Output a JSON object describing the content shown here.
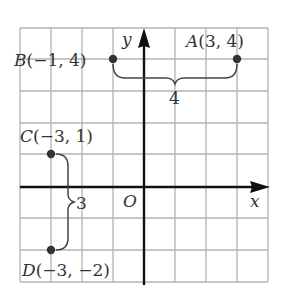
{
  "grid": {
    "x_min": -4,
    "x_max": 4,
    "y_min": -3,
    "y_max": 5,
    "cell_px": 31
  },
  "axes": {
    "x_label": "x",
    "y_label": "y",
    "origin_label": "O"
  },
  "points": [
    {
      "name": "A",
      "x": 3,
      "y": 4,
      "label_name": "A",
      "label_coords": "(3, 4)"
    },
    {
      "name": "B",
      "x": -1,
      "y": 4,
      "label_name": "B",
      "label_coords": "(−1, 4)"
    },
    {
      "name": "C",
      "x": -3,
      "y": 1,
      "label_name": "C",
      "label_coords": "(−3, 1)"
    },
    {
      "name": "D",
      "x": -3,
      "y": -2,
      "label_name": "D",
      "label_coords": "(−3, −2)"
    }
  ],
  "braces": [
    {
      "between": [
        "B",
        "A"
      ],
      "label": "4"
    },
    {
      "between": [
        "C",
        "D"
      ],
      "label": "3"
    }
  ],
  "colors": {
    "grid": "#b0b0b0",
    "axis": "#111111",
    "point": "#333333",
    "text": "#333333"
  }
}
